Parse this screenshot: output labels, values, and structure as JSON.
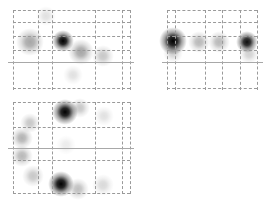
{
  "figure": {
    "panels": [
      {
        "id": "panel-a",
        "box": {
          "x": 8,
          "y": 8,
          "w": 126,
          "h": 84
        },
        "divider_y": 54,
        "vlines": [
          5,
          30,
          44,
          87,
          114,
          122
        ],
        "hlines": [
          2,
          14,
          28,
          42,
          80
        ],
        "spots": [
          {
            "x": 22,
            "y": 34,
            "r": 9,
            "intensity": 0.35
          },
          {
            "x": 55,
            "y": 33,
            "r": 7,
            "intensity": 1.0
          },
          {
            "x": 73,
            "y": 44,
            "r": 8,
            "intensity": 0.35
          },
          {
            "x": 95,
            "y": 48,
            "r": 7,
            "intensity": 0.22
          },
          {
            "x": 38,
            "y": 8,
            "r": 6,
            "intensity": 0.12
          },
          {
            "x": 65,
            "y": 67,
            "r": 6,
            "intensity": 0.12
          }
        ]
      },
      {
        "id": "panel-b",
        "box": {
          "x": 162,
          "y": 8,
          "w": 101,
          "h": 84
        },
        "divider_y": 54,
        "vlines": [
          5,
          13,
          43,
          60,
          78,
          95
        ],
        "hlines": [
          2,
          14,
          28,
          42,
          80
        ],
        "spots": [
          {
            "x": 11,
            "y": 33,
            "r": 9,
            "intensity": 1.0
          },
          {
            "x": 37,
            "y": 34,
            "r": 7,
            "intensity": 0.28
          },
          {
            "x": 57,
            "y": 34,
            "r": 7,
            "intensity": 0.28
          },
          {
            "x": 85,
            "y": 34,
            "r": 7,
            "intensity": 0.95
          },
          {
            "x": 11,
            "y": 45,
            "r": 6,
            "intensity": 0.18
          },
          {
            "x": 87,
            "y": 46,
            "r": 6,
            "intensity": 0.18
          }
        ]
      },
      {
        "id": "panel-c",
        "box": {
          "x": 8,
          "y": 100,
          "w": 126,
          "h": 96
        },
        "divider_y": 48,
        "vlines": [
          5,
          30,
          44,
          87,
          114,
          122
        ],
        "hlines": [
          2,
          27,
          60,
          93
        ],
        "spots": [
          {
            "x": 57,
            "y": 12,
            "r": 8,
            "intensity": 1.0
          },
          {
            "x": 72,
            "y": 8,
            "r": 6,
            "intensity": 0.22
          },
          {
            "x": 22,
            "y": 23,
            "r": 6,
            "intensity": 0.22
          },
          {
            "x": 14,
            "y": 38,
            "r": 7,
            "intensity": 0.3
          },
          {
            "x": 14,
            "y": 56,
            "r": 7,
            "intensity": 0.28
          },
          {
            "x": 25,
            "y": 76,
            "r": 7,
            "intensity": 0.22
          },
          {
            "x": 53,
            "y": 84,
            "r": 8,
            "intensity": 1.0
          },
          {
            "x": 70,
            "y": 89,
            "r": 7,
            "intensity": 0.25
          },
          {
            "x": 95,
            "y": 85,
            "r": 7,
            "intensity": 0.15
          },
          {
            "x": 96,
            "y": 16,
            "r": 6,
            "intensity": 0.12
          },
          {
            "x": 58,
            "y": 45,
            "r": 6,
            "intensity": 0.08
          }
        ]
      }
    ]
  }
}
